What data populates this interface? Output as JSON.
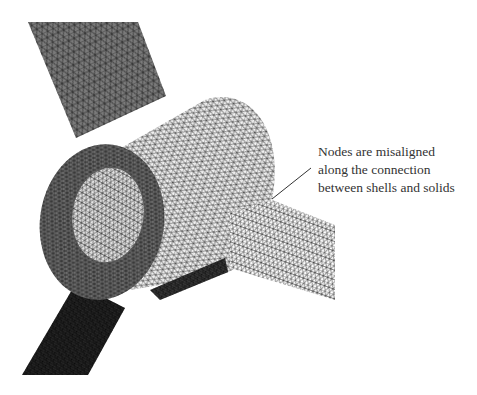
{
  "figure": {
    "colors": {
      "background": "#ffffff",
      "shell_top": "#7a7a7a",
      "shell_bottom": "#262626",
      "solid_face": "#6e6e6e",
      "solid_outer": "#f2f2f2",
      "solid_inner": "#e6e6e6",
      "shell_right": "#ffffff",
      "mesh_line": "#1a1a1a",
      "annotation_text": "#333333",
      "leader_line": "#333333"
    }
  },
  "annotation": {
    "lines": [
      "Nodes are misaligned",
      "along the connection",
      "between shells and solids"
    ]
  }
}
